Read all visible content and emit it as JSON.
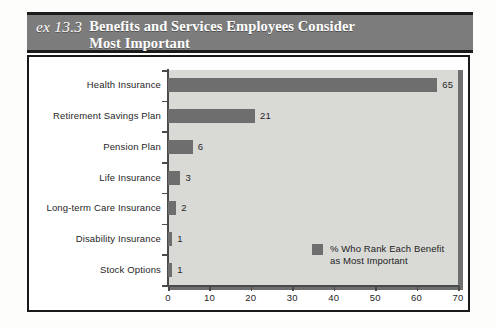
{
  "header": {
    "exhibit_number": "ex 13.3",
    "title_line1": "Benefits and Services Employees Consider",
    "title_line2": "Most Important",
    "bar_color": "#7c7c7c",
    "text_color": "#ffffff"
  },
  "legend": {
    "line1": "% Who Rank Each Benefit",
    "line2": "as Most Important",
    "swatch_color": "#6e6e6e"
  },
  "chart_data": {
    "type": "bar",
    "orientation": "horizontal",
    "title": "Benefits and Services Employees Consider Most Important",
    "categories": [
      "Health Insurance",
      "Retirement Savings Plan",
      "Pension Plan",
      "Life Insurance",
      "Long-term Care Insurance",
      "Disability Insurance",
      "Stock Options"
    ],
    "values": [
      65,
      21,
      6,
      3,
      2,
      1,
      1
    ],
    "value_labels": [
      "65",
      "21",
      "6",
      "3",
      "2",
      "1",
      "1"
    ],
    "series": [
      {
        "name": "% Who Rank Each Benefit as Most Important",
        "values": [
          65,
          21,
          6,
          3,
          2,
          1,
          1
        ],
        "color": "#6e6e6e"
      }
    ],
    "xlabel": "",
    "ylabel": "",
    "xlim": [
      0,
      70
    ],
    "xticks": [
      0,
      10,
      20,
      30,
      40,
      50,
      60,
      70
    ],
    "xtick_labels": [
      "0",
      "10",
      "20",
      "30",
      "40",
      "50",
      "60",
      "70"
    ],
    "grid": false,
    "legend_position": "inside-bottom-right",
    "plot_background": "#d9d9d6"
  }
}
